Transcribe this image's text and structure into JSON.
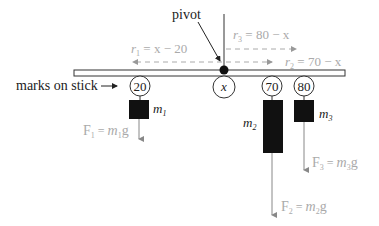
{
  "diagram": {
    "labels": {
      "pivot": "pivot",
      "marks_on_stick": "marks on stick",
      "r1": {
        "sym": "r",
        "sub": "1",
        "expr": " = x − 20"
      },
      "r2": {
        "sym": "r",
        "sub": "2",
        "expr": " = 70 − x"
      },
      "r3": {
        "sym": "r",
        "sub": "3",
        "expr": " = 80 − x"
      }
    },
    "marks": [
      {
        "id": "mark-20",
        "value": "20"
      },
      {
        "id": "mark-x",
        "value": "x"
      },
      {
        "id": "mark-70",
        "value": "70"
      },
      {
        "id": "mark-80",
        "value": "80"
      }
    ],
    "masses": [
      {
        "id": "m1",
        "sym": "m",
        "sub": "1"
      },
      {
        "id": "m2",
        "sym": "m",
        "sub": "2"
      },
      {
        "id": "m3",
        "sym": "m",
        "sub": "3"
      }
    ],
    "forces": [
      {
        "id": "F1",
        "sym": "F",
        "sub": "1",
        "eq": " = ",
        "m": "m",
        "msub": "1",
        "g": "g"
      },
      {
        "id": "F2",
        "sym": "F",
        "sub": "2",
        "eq": " = ",
        "m": "m",
        "msub": "2",
        "g": "g"
      },
      {
        "id": "F3",
        "sym": "F",
        "sub": "3",
        "eq": " = ",
        "m": "m",
        "msub": "3",
        "g": "g"
      }
    ],
    "colors": {
      "ink": "#222222",
      "annotation": "#aaaaaa",
      "mass_fill": "#111111"
    }
  }
}
